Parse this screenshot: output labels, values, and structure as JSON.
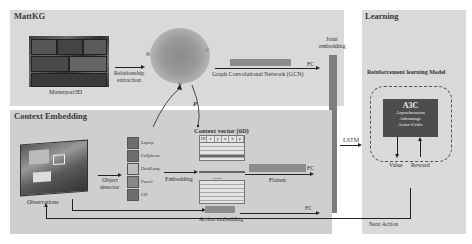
{
  "panels": {
    "mattkg": {
      "title": "MattKG"
    },
    "context": {
      "title": "Context Embedding"
    },
    "learning": {
      "title": "Learning"
    }
  },
  "mattkg": {
    "matterport_label": "Matterport3D",
    "relationship_label_line1": "Relationship",
    "relationship_label_line2": "extraction",
    "gcn_label": "Graph Convolutional Network  (GCN)",
    "fc_label": "FC",
    "p_label": "P"
  },
  "joint": {
    "label_line1": "Joint",
    "label_line2": "embedding"
  },
  "context": {
    "observations_label": "Observations",
    "object_detector_line1": "Object",
    "object_detector_line2": "detector",
    "objects": [
      {
        "name": "Laptop"
      },
      {
        "name": "Cellphone"
      },
      {
        "name": "DeskLamp"
      },
      {
        "name": "Pencil"
      },
      {
        "name": "CD"
      }
    ],
    "embedding_label": "Embedding",
    "context_vector_title": "Context vector (6D)",
    "context_vector_columns": [
      "ID",
      "x",
      "y",
      "w",
      "h",
      "p"
    ],
    "dots": "......",
    "flatten_label": "Flatten",
    "fc_label": "FC",
    "action_embedding_label": "Action embedding",
    "action_fc_label": "FC"
  },
  "lstm_label": "LSTM",
  "learning": {
    "model_title": "Reinforcement learning Model",
    "a3c_title": "A3C",
    "a3c_line1": "Asynchronous",
    "a3c_line2": "Advantage",
    "a3c_line3": "Actor-Critic",
    "value_label": "Value",
    "reward_label": "Reward",
    "next_action_label": "Next Action"
  },
  "colors": {
    "panel_bg": "#d9d9d9",
    "bar": "#8c8c8c",
    "a3c_box": "#4d4d4d"
  }
}
